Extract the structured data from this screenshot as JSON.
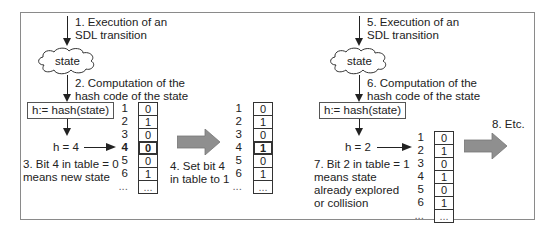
{
  "left_panel": {
    "step1": [
      "1. Execution of an",
      "SDL transition"
    ],
    "state_label": "state",
    "step2": [
      "2. Computation of the",
      "hash code of the state"
    ],
    "hash_expr": "h:= hash(state)",
    "h_value": "h = 4",
    "step3": [
      "3. Bit 4 in table = 0",
      "means new state"
    ],
    "table": {
      "indices": [
        "1",
        "2",
        "3",
        "4",
        "5",
        "6",
        "..."
      ],
      "bits": [
        "0",
        "1",
        "0",
        "0",
        "0",
        "1",
        "..."
      ],
      "highlight_index": 4
    }
  },
  "middle": {
    "step4": [
      "4. Set bit 4",
      "in table to 1"
    ],
    "table": {
      "indices": [
        "1",
        "2",
        "3",
        "4",
        "5",
        "6",
        "..."
      ],
      "bits": [
        "0",
        "1",
        "0",
        "1",
        "0",
        "1",
        "..."
      ],
      "highlight_index": 4
    }
  },
  "right_panel": {
    "step5": [
      "5. Execution of an",
      "SDL transition"
    ],
    "state_label": "state",
    "step6": [
      "6. Computation of the",
      "hash code of the state"
    ],
    "hash_expr": "h:= hash(state)",
    "h_value": "h = 2",
    "step7": [
      "7. Bit 2 in table = 1",
      "means state",
      "already explored",
      "or collision"
    ],
    "table": {
      "indices": [
        "1",
        "2",
        "3",
        "4",
        "5",
        "6",
        "..."
      ],
      "bits": [
        "0",
        "1",
        "0",
        "1",
        "0",
        "1",
        "..."
      ]
    },
    "step8": "8. Etc."
  },
  "colors": {
    "arrow_fill": "#8f8f8f",
    "frame": "#8a8a8a",
    "ink": "#222222"
  }
}
